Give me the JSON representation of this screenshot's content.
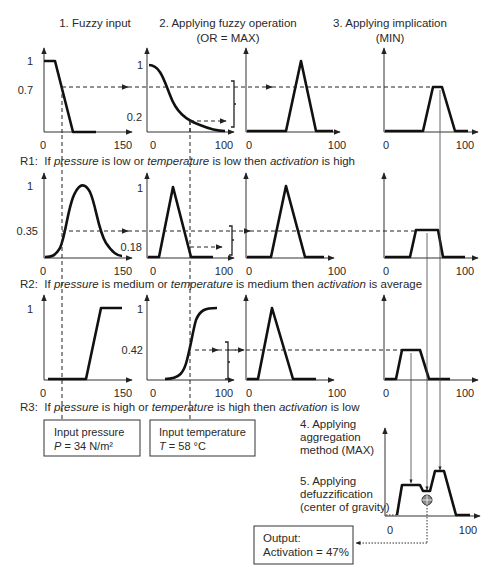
{
  "headers": {
    "step1": "1. Fuzzy input",
    "step2_line1": "2. Applying fuzzy operation",
    "step2_line2": "(OR = MAX)",
    "step3_line1": "3. Applying implication",
    "step3_line2": "(MIN)",
    "step4_line1": "4. Applying",
    "step4_line2": "aggregation",
    "step4_line3": "method (MAX)",
    "step5_line1": "5. Applying",
    "step5_line2": "defuzzification",
    "step5_line3": "(center of gravity)"
  },
  "rules": [
    {
      "prefix": "R1:  If ",
      "var1": "pressure",
      "mid1": " is low or ",
      "var2": "temperature",
      "mid2": " is low then ",
      "var3": "activation",
      "end": " is high"
    },
    {
      "prefix": "R2:  If ",
      "var1": "pressure",
      "mid1": " is medium or ",
      "var2": "temperature",
      "mid2": " is medium then ",
      "var3": "activation",
      "end": " is average"
    },
    {
      "prefix": "R3:  If ",
      "var1": "pressure",
      "mid1": " is high or ",
      "var2": "temperature",
      "mid2": " is high then ",
      "var3": "activation",
      "end": " is low"
    }
  ],
  "axis_labels": {
    "zero": "0",
    "pressure_max": "150",
    "temp_max": "100",
    "activation_max": "100",
    "one": "1"
  },
  "membership_values": {
    "r1_pressure": "0.7",
    "r1_temperature": "0.2",
    "r2_pressure": "0.35",
    "r2_temperature": "0.18",
    "r3_temperature": "0.42"
  },
  "inputs": {
    "pressure_label": "Input pressure",
    "pressure_sym": "P",
    "pressure_val": " = 34 N/m²",
    "temperature_label": "Input temperature",
    "temperature_sym": "T",
    "temperature_val": " = 58 °C"
  },
  "output": {
    "line1": "Output:",
    "line2": "Activation = 47%"
  },
  "icons": {
    "centroid": "crosshair-circle-icon"
  }
}
